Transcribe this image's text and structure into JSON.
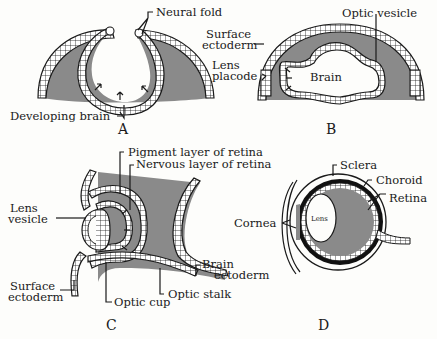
{
  "colors": {
    "tissue_fill": "#8a8a8a",
    "ink": "#1a1a1a",
    "background": "#fdfdfb"
  },
  "panels": {
    "A": {
      "letter": "A",
      "labels": {
        "neural_fold": "Neural fold",
        "developing_brain": "Developing brain"
      }
    },
    "B": {
      "letter": "B",
      "labels": {
        "surface_ectoderm_1": "Surface",
        "surface_ectoderm_2": "ectoderm",
        "lens_placode_1": "Lens",
        "lens_placode_2": "placode",
        "brain": "Brain",
        "optic_vesicle": "Optic vesicle"
      }
    },
    "C": {
      "letter": "C",
      "labels": {
        "pigment_layer": "Pigment layer of retina",
        "nervous_layer": "Nervous layer of retina",
        "lens_vesicle_1": "Lens",
        "lens_vesicle_2": "vesicle",
        "surface_ectoderm_1": "Surface",
        "surface_ectoderm_2": "ectoderm",
        "optic_cup": "Optic cup",
        "optic_stalk": "Optic stalk",
        "brain_ectoderm_1": "Brain",
        "brain_ectoderm_2": "ectoderm"
      }
    },
    "D": {
      "letter": "D",
      "labels": {
        "sclera": "Sclera",
        "choroid": "Choroid",
        "retina": "Retina",
        "cornea": "Cornea",
        "lens": "Lens"
      }
    }
  }
}
